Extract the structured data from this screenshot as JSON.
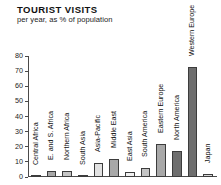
{
  "header": {
    "title": "TOURIST VISITS",
    "subtitle": "per year, as % of population"
  },
  "chart_data": {
    "type": "bar",
    "title": "TOURIST VISITS",
    "subtitle": "per year, as % of population",
    "xlabel": "",
    "ylabel": "",
    "ylim": [
      0,
      80
    ],
    "yticks": [
      0,
      10,
      20,
      30,
      40,
      50,
      60,
      70,
      80
    ],
    "grid": false,
    "legend": false,
    "categories": [
      "Central Africa",
      "E. and S. Africa",
      "Northern Africa",
      "South Asia",
      "Asia-Pacific",
      "Middle East",
      "East Asia",
      "South America",
      "Eastern Europe",
      "North America",
      "Western Europe",
      "Japan"
    ],
    "values": [
      1,
      4,
      4,
      1,
      9,
      12,
      3,
      6,
      22,
      17,
      73,
      2
    ],
    "bar_colors": [
      "#d9d9d9",
      "#a8a8a8",
      "#c4c4c4",
      "#d9d9d9",
      "#e2e2e2",
      "#a8a8a8",
      "#f0f0f0",
      "#c4c4c4",
      "#a8a8a8",
      "#6e6e6e",
      "#6e6e6e",
      "#d9d9d9"
    ]
  },
  "axis": {
    "tick_labels": [
      "0",
      "10",
      "20",
      "30",
      "40",
      "50",
      "60",
      "70",
      "80"
    ]
  }
}
